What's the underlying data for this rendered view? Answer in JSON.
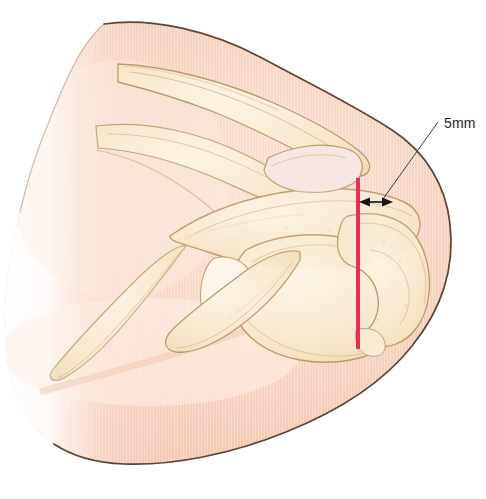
{
  "figure": {
    "background_color": "#ffffff"
  },
  "annotation": {
    "measurement_label": "5mm",
    "label_x": 444,
    "label_y": 128,
    "leader_line": {
      "x1": 438,
      "y1": 122,
      "x2": 383,
      "y2": 199,
      "color": "#3b3b3b"
    },
    "dimension_arrow": {
      "x1": 361,
      "y1": 202,
      "x2": 391,
      "y2": 202,
      "color": "#161616"
    }
  },
  "marker_line": {
    "name": "resection-reference-line",
    "color": "#ef2b55",
    "x": 358,
    "y_top": 178,
    "y_bottom": 349,
    "width": 4
  },
  "palette": {
    "skin_light": "#fae0d2",
    "skin_mid": "#f4c9b5",
    "skin_deep": "#eebca6",
    "skin_outline": "#4f3526",
    "bone_light": "#fdf3e0",
    "bone_mid": "#f7e7c9",
    "bone_shadow": "#eed9b4",
    "bone_outline": "#bb9a6c",
    "bone_outline_soft": "#d2b78e",
    "accent_red": "#ef2b55",
    "annotation_black": "#231f20"
  },
  "structures": [
    {
      "name": "skin-envelope",
      "label": "Skin / soft tissue envelope"
    },
    {
      "name": "clavicle",
      "label": "Clavicle"
    },
    {
      "name": "acromion",
      "label": "Acromion"
    },
    {
      "name": "acromioclavicular-joint",
      "label": "Acromioclavicular joint"
    },
    {
      "name": "coracoid-process",
      "label": "Coracoid process"
    },
    {
      "name": "scapular-spine",
      "label": "Scapular spine"
    },
    {
      "name": "humeral-head",
      "label": "Humeral head"
    },
    {
      "name": "greater-tuberosity",
      "label": "Greater tuberosity"
    },
    {
      "name": "glenoid",
      "label": "Glenoid"
    }
  ]
}
